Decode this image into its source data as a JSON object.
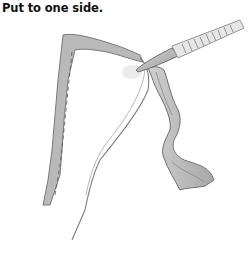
{
  "caption": {
    "text": "Put to one side."
  },
  "illustration": {
    "description": "Pencil sketch of a knife trimming a long strip from the edge of a folded flap",
    "elements": [
      "knife",
      "flap",
      "cut-strip"
    ],
    "colors": {
      "ink": "#6a6a6a",
      "shade_dark": "#8c8c8c",
      "shade_light": "#c8c8c8",
      "paper": "#ffffff"
    }
  }
}
